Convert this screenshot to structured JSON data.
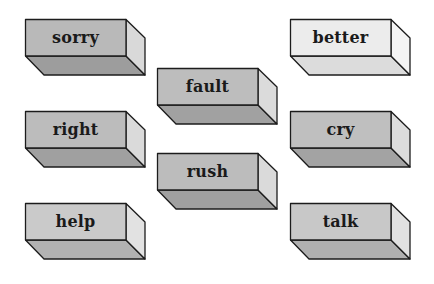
{
  "diagram": {
    "type": "word-blocks",
    "depth": {
      "dx": 19,
      "dy": 19
    },
    "face_size": {
      "width": 101,
      "height": 37
    },
    "blocks": [
      {
        "id": "sorry",
        "label": "sorry",
        "x": 25,
        "y": 19,
        "front": "#b9b9b9",
        "bottom": "#9d9d9d",
        "side": "#d9d9d9"
      },
      {
        "id": "right",
        "label": "right",
        "x": 25,
        "y": 111,
        "front": "#bcbcbc",
        "bottom": "#a0a0a0",
        "side": "#dadada"
      },
      {
        "id": "help",
        "label": "help",
        "x": 25,
        "y": 203,
        "front": "#cacaca",
        "bottom": "#b2b2b2",
        "side": "#e2e2e2"
      },
      {
        "id": "fault",
        "label": "fault",
        "x": 157,
        "y": 68,
        "front": "#bdbdbd",
        "bottom": "#a1a1a1",
        "side": "#dbdbdb"
      },
      {
        "id": "rush",
        "label": "rush",
        "x": 157,
        "y": 153,
        "front": "#bcbcbc",
        "bottom": "#a0a0a0",
        "side": "#dadada"
      },
      {
        "id": "better",
        "label": "better",
        "x": 290,
        "y": 19,
        "front": "#ececec",
        "bottom": "#dcdcdc",
        "side": "#f4f4f4"
      },
      {
        "id": "cry",
        "label": "cry",
        "x": 290,
        "y": 111,
        "front": "#bfbfbf",
        "bottom": "#a3a3a3",
        "side": "#dcdcdc"
      },
      {
        "id": "talk",
        "label": "talk",
        "x": 290,
        "y": 203,
        "front": "#c8c8c8",
        "bottom": "#b0b0b0",
        "side": "#e1e1e1"
      }
    ],
    "stroke": "#1c1c1c"
  }
}
